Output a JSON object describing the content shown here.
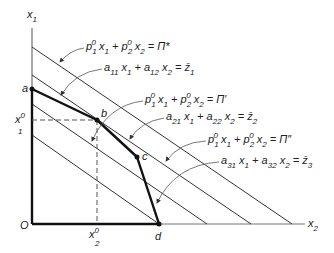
{
  "figure": {
    "axes": {
      "vertical_label": "x",
      "vertical_label_sub": "1",
      "horizontal_label": "x",
      "horizontal_label_sub": "2",
      "origin_label": "O"
    },
    "reference": {
      "x1_label": "x",
      "x1_sup": "0",
      "x1_sub": "1",
      "x2_label": "x",
      "x2_sup": "0",
      "x2_sub": "2"
    },
    "points": [
      {
        "id": "a",
        "label": "a"
      },
      {
        "id": "b",
        "label": "b"
      },
      {
        "id": "c",
        "label": "c"
      },
      {
        "id": "d",
        "label": "d"
      }
    ],
    "iso_profit_levels": [
      "Π*",
      "Π′",
      "Π″",
      "lowest"
    ],
    "equations": [
      {
        "id": "pi-star",
        "parts": [
          "p",
          "1",
          "0",
          " x",
          "1",
          " + p",
          "2",
          "0",
          " x",
          "2",
          " = Π*"
        ]
      },
      {
        "id": "constraint-1",
        "parts": [
          "a",
          "11",
          " x",
          "1",
          " + a",
          "12",
          " x",
          "2",
          " = z̄",
          "1"
        ]
      },
      {
        "id": "pi-prime",
        "parts": [
          "p",
          "1",
          "0",
          " x",
          "1",
          " + p",
          "2",
          "0",
          " x",
          "2",
          " = Π′"
        ]
      },
      {
        "id": "constraint-2",
        "parts": [
          "a",
          "21",
          " x",
          "1",
          " + a",
          "22",
          " x",
          "2",
          " = z̄",
          "2"
        ]
      },
      {
        "id": "pi-double-prime",
        "parts": [
          "p",
          "1",
          "0",
          " x",
          "1",
          " + p",
          "2",
          "0",
          " x",
          "2",
          " = Π″"
        ]
      },
      {
        "id": "constraint-3",
        "parts": [
          "a",
          "31",
          " x",
          "1",
          " + a",
          "32",
          " x",
          "2",
          " = z̄",
          "3"
        ]
      }
    ]
  }
}
